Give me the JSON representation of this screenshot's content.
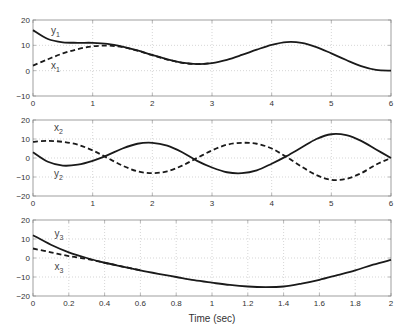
{
  "chart_data": [
    {
      "type": "line",
      "panel": 1,
      "xlim": [
        0,
        6
      ],
      "ylim": [
        -10,
        20
      ],
      "xticks": [
        0,
        1,
        2,
        3,
        4,
        5,
        6
      ],
      "yticks": [
        -10,
        0,
        10,
        20
      ],
      "grid": true,
      "xlabel": "",
      "ylabel": "",
      "annotations": [
        {
          "text": "y",
          "sub": "1",
          "x": 0.3,
          "y": 14.5
        },
        {
          "text": "x",
          "sub": "1",
          "x": 0.3,
          "y": 0.5
        }
      ],
      "series": [
        {
          "name": "y1",
          "style": "solid",
          "x": [
            0,
            0.25,
            0.5,
            0.75,
            1.0,
            1.25,
            1.5,
            1.75,
            2.0,
            2.25,
            2.5,
            2.75,
            3.0,
            3.25,
            3.5,
            3.75,
            4.0,
            4.25,
            4.5,
            4.75,
            5.0,
            5.25,
            5.5,
            5.75,
            6.0
          ],
          "values": [
            16,
            12.5,
            11.2,
            11,
            11,
            10.6,
            9.5,
            8,
            6.2,
            4.5,
            3.2,
            2.6,
            3,
            4.3,
            6.2,
            8.3,
            10.2,
            11.3,
            11,
            9.3,
            6.8,
            4.2,
            1.8,
            0.3,
            0
          ]
        },
        {
          "name": "x1",
          "style": "dashed",
          "x": [
            0,
            0.25,
            0.5,
            0.75,
            1.0,
            1.25,
            1.5,
            1.75,
            2.0,
            2.25,
            2.5,
            2.75,
            3.0
          ],
          "values": [
            2,
            4.5,
            6.8,
            8.5,
            9.6,
            9.9,
            9.3,
            7.9,
            6.1,
            4.4,
            3.1,
            2.6,
            3
          ]
        }
      ]
    },
    {
      "type": "line",
      "panel": 2,
      "xlim": [
        0,
        6
      ],
      "ylim": [
        -20,
        20
      ],
      "xticks": [
        0,
        1,
        2,
        3,
        4,
        5,
        6
      ],
      "yticks": [
        -20,
        -10,
        0,
        10,
        20
      ],
      "grid": true,
      "xlabel": "",
      "ylabel": "",
      "annotations": [
        {
          "text": "x",
          "sub": "2",
          "x": 0.35,
          "y": 14
        },
        {
          "text": "y",
          "sub": "2",
          "x": 0.35,
          "y": -10
        }
      ],
      "series": [
        {
          "name": "y2",
          "style": "solid",
          "x": [
            0,
            0.25,
            0.5,
            0.75,
            1.0,
            1.25,
            1.5,
            1.75,
            2.0,
            2.25,
            2.5,
            2.75,
            3.0,
            3.25,
            3.5,
            3.75,
            4.0,
            4.25,
            4.5,
            4.75,
            5.0,
            5.25,
            5.5,
            5.75,
            6.0
          ],
          "values": [
            3,
            -2,
            -4,
            -3.5,
            -1.5,
            1.5,
            5,
            7.5,
            8,
            6.5,
            3,
            -1.5,
            -5,
            -7.5,
            -8,
            -6.5,
            -3,
            1,
            5.5,
            10,
            12.5,
            12,
            9,
            4.5,
            0
          ]
        },
        {
          "name": "x2",
          "style": "dashed",
          "x": [
            0,
            0.25,
            0.5,
            0.75,
            1.0,
            1.25,
            1.5,
            1.75,
            2.0,
            2.25,
            2.5,
            2.75,
            3.0,
            3.25,
            3.5,
            3.75,
            4.0,
            4.25,
            4.5,
            4.75,
            5.0,
            5.25,
            5.5,
            5.75,
            6.0
          ],
          "values": [
            8.5,
            9,
            8.5,
            7,
            4,
            0,
            -4,
            -7,
            -8,
            -7,
            -4,
            0,
            4,
            7,
            8,
            7.5,
            5,
            0.5,
            -4.5,
            -9,
            -11.5,
            -11,
            -8,
            -3.5,
            0
          ]
        }
      ]
    },
    {
      "type": "line",
      "panel": 3,
      "xlim": [
        0,
        2
      ],
      "ylim": [
        -20,
        20
      ],
      "xticks": [
        0,
        0.2,
        0.4,
        0.6,
        0.8,
        1,
        1.2,
        1.4,
        1.6,
        1.8,
        2
      ],
      "xtick_labels": [
        "0",
        "0.2",
        "0.4",
        "0.6",
        "0.8",
        "1",
        "1.2",
        "1.4",
        "1.6",
        "1.8",
        "2"
      ],
      "yticks": [
        -20,
        -10,
        0,
        10,
        20
      ],
      "grid": true,
      "xlabel": "Time (sec)",
      "ylabel": "",
      "annotations": [
        {
          "text": "y",
          "sub": "3",
          "x": 0.12,
          "y": 11
        },
        {
          "text": "x",
          "sub": "3",
          "x": 0.12,
          "y": -6.5
        }
      ],
      "series": [
        {
          "name": "y3",
          "style": "solid",
          "x": [
            0,
            0.1,
            0.2,
            0.3,
            0.4,
            0.5,
            0.6,
            0.7,
            0.8,
            0.9,
            1.0,
            1.1,
            1.2,
            1.3,
            1.4,
            1.5,
            1.6,
            1.7,
            1.8,
            1.9,
            2.0
          ],
          "values": [
            12,
            7,
            3,
            0,
            -2.5,
            -4.5,
            -6.5,
            -8.3,
            -10,
            -11.7,
            -13,
            -14.2,
            -15,
            -15.3,
            -15,
            -13.5,
            -11.5,
            -9,
            -6.5,
            -3.5,
            -1
          ]
        },
        {
          "name": "x3",
          "style": "dashed",
          "x": [
            0,
            0.1,
            0.2,
            0.3,
            0.4,
            0.5,
            0.6
          ],
          "values": [
            5,
            3,
            1,
            -0.5,
            -2.5,
            -4.5,
            -6.5
          ]
        }
      ]
    }
  ],
  "figure": {
    "xlabel": "Time (sec)"
  }
}
